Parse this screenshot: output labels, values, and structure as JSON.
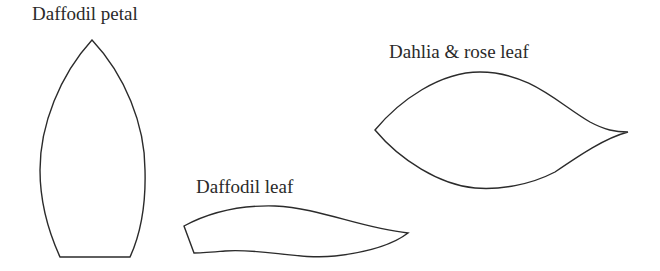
{
  "templates": [
    {
      "id": "daffodil-petal",
      "label": "Daffodil petal"
    },
    {
      "id": "daffodil-leaf",
      "label": "Daffodil leaf"
    },
    {
      "id": "dahlia-rose-leaf",
      "label": "Dahlia & rose leaf"
    }
  ],
  "colors": {
    "stroke": "#2b2b2b",
    "text": "#2a2a2a",
    "background": "#ffffff"
  }
}
